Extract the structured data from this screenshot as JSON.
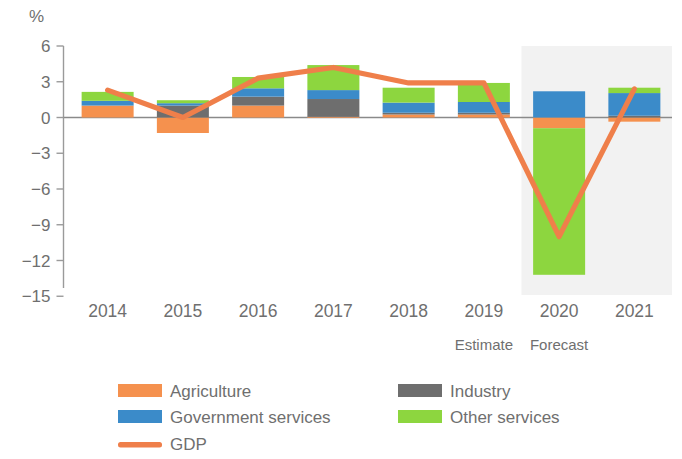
{
  "chart_data": {
    "type": "bar",
    "title": "",
    "subtitle": "",
    "xlabel": "",
    "ylabel": "%",
    "unit_label": "%",
    "ylim": [
      -15,
      6
    ],
    "yticks": [
      6,
      3,
      0,
      -3,
      -6,
      -9,
      -12,
      -15
    ],
    "ytick_labels": [
      "6",
      "3",
      "0",
      "−3",
      "−6",
      "−9",
      "−12",
      "−15"
    ],
    "grid": false,
    "stacked": true,
    "categories": [
      "2014",
      "2015",
      "2016",
      "2017",
      "2018",
      "2019",
      "2020",
      "2021"
    ],
    "legend_position": "bottom",
    "annotations": [
      {
        "text": "Estimate",
        "category": "2019"
      },
      {
        "text": "Forecast",
        "category": "2020"
      }
    ],
    "shaded_region": {
      "from_category": "2020",
      "label": "Forecast",
      "color": "#f2f2f2"
    },
    "series": [
      {
        "name": "Agriculture",
        "color": "#f5914e",
        "type": "bar-segment",
        "values": [
          1.0,
          -1.3,
          1.0,
          0.05,
          0.25,
          0.25,
          -0.9,
          -0.35
        ]
      },
      {
        "name": "Industry",
        "color": "#6e6e6e",
        "type": "bar-segment",
        "values": [
          0.0,
          1.0,
          0.75,
          1.5,
          0.15,
          0.15,
          0.0,
          0.15
        ]
      },
      {
        "name": "Government services",
        "color": "#3b8bc9",
        "type": "bar-segment",
        "values": [
          0.4,
          0.2,
          0.7,
          0.75,
          0.85,
          0.9,
          2.2,
          1.9
        ]
      },
      {
        "name": "Other services",
        "color": "#8dd63f",
        "type": "bar-segment",
        "values": [
          0.75,
          0.25,
          0.95,
          2.1,
          1.25,
          1.6,
          -12.3,
          0.45
        ]
      },
      {
        "name": "GDP",
        "color": "#ef7f4a",
        "type": "line",
        "values": [
          2.3,
          0.0,
          3.3,
          4.2,
          2.9,
          2.9,
          -10.0,
          2.4
        ]
      }
    ],
    "legend": [
      {
        "label": "Agriculture",
        "color": "#f5914e",
        "marker": "swatch"
      },
      {
        "label": "Industry",
        "color": "#6e6e6e",
        "marker": "swatch"
      },
      {
        "label": "Government services",
        "color": "#3b8bc9",
        "marker": "swatch"
      },
      {
        "label": "Other services",
        "color": "#8dd63f",
        "marker": "swatch"
      },
      {
        "label": "GDP",
        "color": "#ef7f4a",
        "marker": "line"
      }
    ]
  }
}
